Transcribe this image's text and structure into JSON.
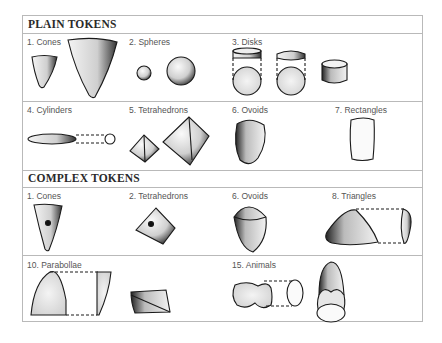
{
  "sections": [
    {
      "title": "PLAIN TOKENS",
      "cells": [
        {
          "label": "1. Cones",
          "shape": "cone"
        },
        {
          "label": "2. Spheres",
          "shape": "sphere"
        },
        {
          "label": "3. Disks",
          "shape": "disk"
        },
        {
          "label": "4. Cylinders",
          "shape": "cylinder"
        },
        {
          "label": "5. Tetrahedrons",
          "shape": "tetrahedron"
        },
        {
          "label": "6. Ovoids",
          "shape": "ovoid"
        },
        {
          "label": "7. Rectangles",
          "shape": "rectangle"
        }
      ]
    },
    {
      "title": "COMPLEX TOKENS",
      "cells": [
        {
          "label": "1. Cones",
          "shape": "cone-punctated"
        },
        {
          "label": "2. Tetrahedrons",
          "shape": "tetrahedron-punctated"
        },
        {
          "label": "6. Ovoids",
          "shape": "ovoid-incised"
        },
        {
          "label": "8. Triangles",
          "shape": "triangle"
        },
        {
          "label": "10. Parabollae",
          "shape": "parabola"
        },
        {
          "label": "15. Animals",
          "shape": "animal"
        }
      ]
    }
  ],
  "colors": {
    "border": "#b9b9b9",
    "ink": "#1a1a1a",
    "label": "#555555"
  }
}
